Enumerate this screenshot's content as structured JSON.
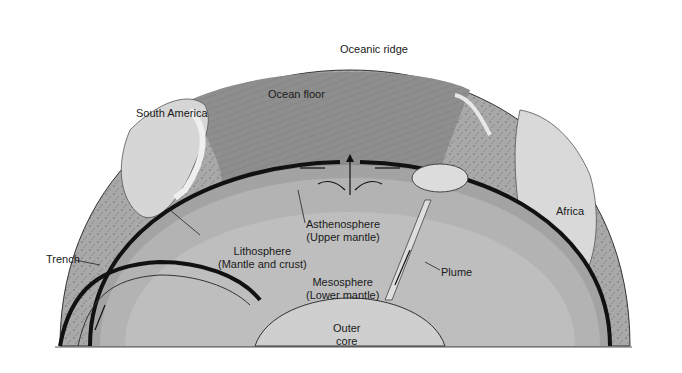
{
  "diagram": {
    "colors": {
      "background": "#ffffff",
      "surface_land": "#a8a8a8",
      "continent_light": "#d9d9d9",
      "ocean_floor": "#8f8f8f",
      "lithosphere": "#a0a0a0",
      "asthenosphere": "#b4b4b4",
      "mesosphere": "#bdbdbd",
      "outer_core": "#d0d0d0",
      "plume": "#dcdcdc",
      "plate_edge": "#111111"
    },
    "labels": {
      "oceanic_ridge": "Oceanic ridge",
      "ocean_floor": "Ocean floor",
      "south_america": "South America",
      "africa": "Africa",
      "trench": "Trench",
      "asthenosphere_line1": "Asthenosphere",
      "asthenosphere_line2": "(Upper mantle)",
      "lithosphere_line1": "Lithosphere",
      "lithosphere_line2": "(Mantle and crust)",
      "mesosphere_line1": "Mesosphere",
      "mesosphere_line2": "(Lower mantle)",
      "plume": "Plume",
      "outer_core_line1": "Outer",
      "outer_core_line2": "core"
    }
  }
}
